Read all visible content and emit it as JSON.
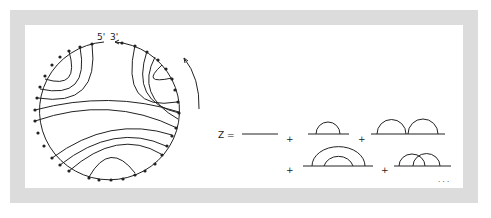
{
  "figure": {
    "circle_labels": {
      "five_prime": "5'",
      "three_prime": "3'"
    },
    "equation": {
      "lhs": "Z =",
      "plus": "+",
      "ellipsis": "· · ·",
      "terms": [
        "bare-line",
        "single-arc",
        "two-adjacent-arcs",
        "nested-arcs",
        "crossing-arcs"
      ]
    },
    "colors": {
      "frame": "#dcdcdc",
      "ink": "#222222",
      "background": "#ffffff"
    }
  }
}
